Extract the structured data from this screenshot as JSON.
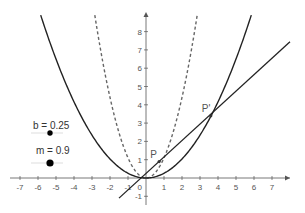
{
  "graphics_view": {
    "origin_px": [
      146,
      178
    ],
    "unit_px": [
      18,
      18.3
    ],
    "x_ticks": [
      -7,
      -6,
      -5,
      -4,
      -3,
      -2,
      -1,
      1,
      2,
      3,
      4,
      5,
      6,
      7
    ],
    "y_ticks": [
      -1,
      1,
      2,
      3,
      4,
      5,
      6,
      7,
      8
    ],
    "origin_label": "0",
    "axis_color": "#555555",
    "label_color": "#555555"
  },
  "sliders": [
    {
      "name": "b",
      "label": "b = 0.25",
      "value": 0.25
    },
    {
      "name": "m",
      "label": "m = 0.9",
      "value": 0.9
    }
  ],
  "objects": {
    "parabola_solid": {
      "a": 0.26,
      "style": "solid",
      "color": "#222222"
    },
    "parabola_dashed": {
      "a": 1.1,
      "style": "dashed",
      "color": "#666666"
    },
    "line": {
      "m": 0.9,
      "b": 0.25,
      "color": "#222222"
    },
    "points": [
      {
        "label": "P",
        "x": 0.73,
        "y": 0.9
      },
      {
        "label": "P'",
        "x": 3.6,
        "y": 3.4
      }
    ]
  }
}
